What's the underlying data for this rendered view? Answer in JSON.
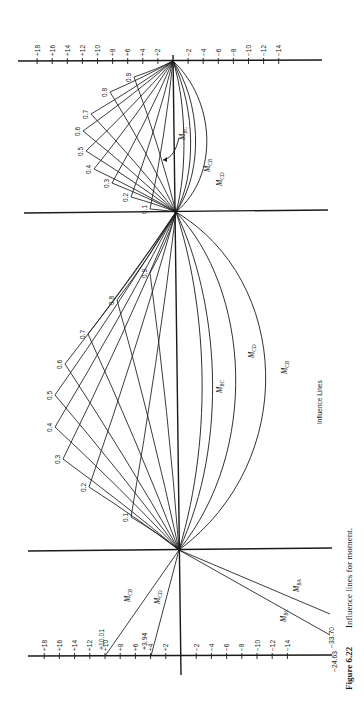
{
  "caption": {
    "figure_number": "Figure 6.22",
    "text": "Influence lines for moment."
  },
  "center_label": "Influence Lines",
  "axis": {
    "positive_ticks": [
      "+18",
      "+16",
      "+14",
      "+12",
      "+10",
      "+8",
      "+6",
      "+4",
      "+2"
    ],
    "negative_ticks": [
      "−2",
      "−4",
      "−6",
      "−8",
      "−10",
      "−12",
      "−14"
    ]
  },
  "spans": {
    "top": {
      "fractions": [
        "0.1",
        "0.2",
        "0.3",
        "0.4",
        "0.5",
        "0.6",
        "0.7",
        "0.8",
        "0.9"
      ],
      "curve_labels": [
        "M_BC",
        "M_CB",
        "M_CD"
      ]
    },
    "middle": {
      "fractions": [
        "0.1",
        "0.2",
        "0.3",
        "0.4",
        "0.5",
        "0.6",
        "0.7",
        "0.8",
        "0.9"
      ],
      "curve_labels": [
        "M_BC",
        "M_CD",
        "M_CB"
      ]
    },
    "bottom": {
      "lines": [
        {
          "label": "M_CB",
          "end_value": "+10.01"
        },
        {
          "label": "M_CD",
          "end_value": "+3.94"
        },
        {
          "label": "M_BC",
          "end_value": "−24.63"
        },
        {
          "label": "M_BA",
          "end_value": "−33.70"
        }
      ]
    }
  },
  "chart_data": {
    "type": "line",
    "title": "Influence lines for moment",
    "orientation": "rotated 90° (span axis vertical, ordinate horizontal; positive values to the left)",
    "axis_range": [
      -14,
      18
    ],
    "axis_ticks": [
      18,
      16,
      14,
      12,
      10,
      8,
      6,
      4,
      2,
      -2,
      -4,
      -6,
      -8,
      -10,
      -12,
      -14
    ],
    "annotations": {
      "cantilever_end_values": {
        "M_CB": 10.01,
        "M_CD": 3.94,
        "M_BC": -24.63,
        "M_BA": -33.7
      }
    },
    "section_fractions": [
      0.1,
      0.2,
      0.3,
      0.4,
      0.5,
      0.6,
      0.7,
      0.8,
      0.9
    ],
    "series": [
      {
        "name": "Span 1 section influence lines",
        "peaks": [
          0.1,
          0.2,
          0.3,
          0.4,
          0.5,
          0.6,
          0.7,
          0.8,
          0.9
        ]
      },
      {
        "name": "Span 2 section influence lines",
        "peaks": [
          0.1,
          0.2,
          0.3,
          0.4,
          0.5,
          0.6,
          0.7,
          0.8,
          0.9
        ]
      },
      {
        "name": "M_BC"
      },
      {
        "name": "M_CB"
      },
      {
        "name": "M_CD"
      },
      {
        "name": "M_BA"
      }
    ]
  }
}
